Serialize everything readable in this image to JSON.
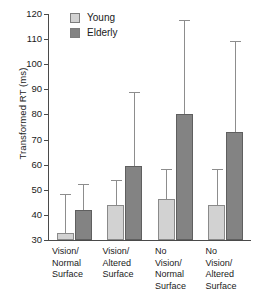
{
  "chart_data": {
    "type": "bar",
    "title": "",
    "xlabel": "",
    "ylabel": "Transformed RT (ms)",
    "ylim": [
      30,
      120
    ],
    "yticks": [
      30,
      40,
      50,
      60,
      70,
      80,
      90,
      100,
      110,
      120
    ],
    "ytick_labels": [
      "30",
      "40",
      "50",
      "60",
      "70",
      "80",
      "90",
      "100",
      "110",
      "120"
    ],
    "grid": false,
    "legend_position": "top-left-inside",
    "categories": [
      "Vision/\nNormal\nSurface",
      "Vision/\nAltered\nSurface",
      "No\nVision/\nNormal\nSurface",
      "No\nVision/\nAltered\nSurface"
    ],
    "series": [
      {
        "name": "Young",
        "color": "#d2d2d2",
        "values": [
          32.8,
          43.8,
          46.5,
          43.8
        ],
        "error_high": [
          48.3,
          53.9,
          58.3,
          58.3
        ]
      },
      {
        "name": "Elderly",
        "color": "#838383",
        "values": [
          41.8,
          59.5,
          80.0,
          73.2
        ],
        "error_high": [
          52.3,
          89.0,
          117.7,
          109.3
        ]
      }
    ]
  },
  "legend": {
    "items": [
      {
        "label": "Young",
        "swatch": "young"
      },
      {
        "label": "Elderly",
        "swatch": "elderly"
      }
    ]
  },
  "axis": {
    "y_title": "Transformed RT (ms)"
  }
}
